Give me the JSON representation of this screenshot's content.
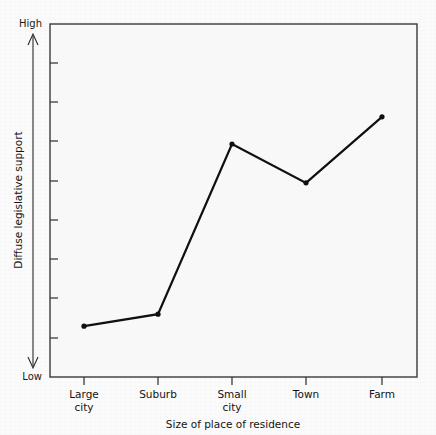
{
  "figure": {
    "background_color": "#fbfbfb",
    "plot_background_color": "#f8f8f8",
    "frame_color": "#3a3a3a",
    "line_color": "#101010",
    "marker_color": "#101010"
  },
  "axis": {
    "y_label": "Diffuse legislative support",
    "y_high_label": "High",
    "y_low_label": "Low",
    "x_title": "Size of place of residence",
    "y_tick_count": "8"
  },
  "categories_display": [
    {
      "line1": "Large",
      "line2": "city"
    },
    {
      "line1": "Suburb",
      "line2": ""
    },
    {
      "line1": "Small",
      "line2": "city"
    },
    {
      "line1": "Town",
      "line2": ""
    },
    {
      "line1": "Farm",
      "line2": ""
    }
  ],
  "chart_data": {
    "type": "line",
    "title": "",
    "subtitle": "",
    "xlabel": "Size of place of residence",
    "ylabel": "Diffuse legislative support",
    "categories": [
      "Large city",
      "Suburb",
      "Small city",
      "Town",
      "Farm"
    ],
    "values": [
      14.4,
      17.8,
      66.0,
      55.0,
      73.7
    ],
    "ylim": [
      0,
      100
    ],
    "y_tick_labels": [
      "Low",
      "High"
    ],
    "y_axis_qualitative": true,
    "y_tick_positions": [
      10,
      20,
      30,
      40,
      50,
      60,
      70,
      80,
      90
    ],
    "grid": false,
    "legend": null,
    "markers": true,
    "annotations": []
  }
}
